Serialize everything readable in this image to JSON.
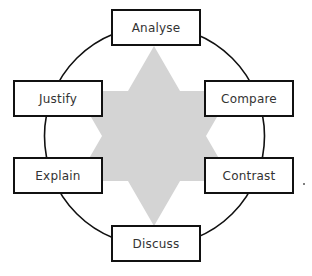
{
  "diagram": {
    "type": "cycle-with-star",
    "colors": {
      "star_fill": "#d4d4d4",
      "circle_stroke": "#111111",
      "box_border": "#111111",
      "box_fill": "#ffffff",
      "text": "#333333"
    },
    "nodes": [
      {
        "id": "analyse",
        "label": "Analyse",
        "position": "top"
      },
      {
        "id": "compare",
        "label": "Compare",
        "position": "upper-right"
      },
      {
        "id": "contrast",
        "label": "Contrast",
        "position": "lower-right"
      },
      {
        "id": "discuss",
        "label": "Discuss",
        "position": "bottom"
      },
      {
        "id": "explain",
        "label": "Explain",
        "position": "lower-left"
      },
      {
        "id": "justify",
        "label": "Justify",
        "position": "upper-left"
      }
    ]
  }
}
